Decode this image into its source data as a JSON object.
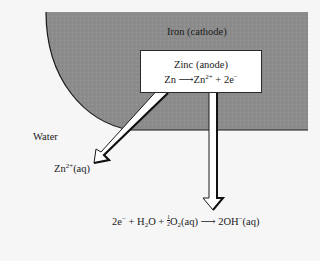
{
  "colors": {
    "background": "#f6f6f6",
    "iron_fill": "#8c8c8c",
    "box_fill": "#ffffff",
    "outline": "#1a1a1a"
  },
  "labels": {
    "iron": "Iron (cathode)",
    "water": "Water",
    "zinc_title": "Zinc (anode)",
    "zinc_reaction": {
      "reactant": "Zn",
      "arrow": "⟶",
      "product": "Zn",
      "product_charge": "2+",
      "electrons": "+ 2e",
      "electron_charge": "−"
    },
    "zinc_ion": {
      "base": "Zn",
      "charge": "2+",
      "state": "(aq)"
    },
    "cathode_reaction": {
      "electrons": "2e",
      "electron_charge": "−",
      "plus1": " + H",
      "h_sub": "2",
      "water_o": "O + ",
      "frac_num": "1",
      "frac_den": "2",
      "o2": "O",
      "o2_sub": "2",
      "o2_state": "(aq) ",
      "arrow": "⟶",
      "product": " 2OH",
      "product_charge": "−",
      "product_state": "(aq)"
    }
  },
  "arrows": [
    {
      "name": "zinc-ion-arrow",
      "direction": "down-left",
      "from": [
        165,
        90
      ],
      "to": [
        95,
        163
      ]
    },
    {
      "name": "electron-arrow",
      "direction": "down",
      "from": [
        213,
        90
      ],
      "to": [
        213,
        210
      ]
    }
  ]
}
